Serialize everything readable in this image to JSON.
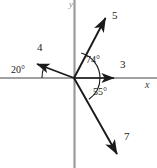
{
  "figure": {
    "type": "angle-diagram",
    "background_color": "#ffffff",
    "axis_color": "#808080",
    "ray_color": "#1a1a1a",
    "arc_color": "#1a1a1a",
    "origin": {
      "x": 74,
      "y": 78
    },
    "axes": {
      "x_label": "x",
      "y_label": "y",
      "x_label_pos": {
        "x": 146,
        "y": 82
      },
      "y_label_pos": {
        "x": 70,
        "y": 1
      },
      "x_start": {
        "x": 0,
        "y": 78
      },
      "x_end": {
        "x": 157,
        "y": 78
      },
      "y_start": {
        "x": 74,
        "y": 0
      },
      "y_end": {
        "x": 74,
        "y": 168
      }
    },
    "rays": [
      {
        "name": "ray-3",
        "label": "3",
        "label_pos": {
          "x": 120,
          "y": 60
        },
        "tip": {
          "x": 118,
          "y": 78
        },
        "angle_deg": 0
      },
      {
        "name": "ray-5",
        "label": "5",
        "label_pos": {
          "x": 113,
          "y": 11
        },
        "tip": {
          "x": 108,
          "y": 14
        },
        "angle_deg": 74
      },
      {
        "name": "ray-4",
        "label": "4",
        "label_pos": {
          "x": 38,
          "y": 43
        },
        "tip": {
          "x": 32,
          "y": 61
        },
        "angle_deg": 160
      },
      {
        "name": "ray-7",
        "label": "7",
        "label_pos": {
          "x": 124,
          "y": 132
        },
        "tip": {
          "x": 121,
          "y": 159
        },
        "angle_deg": -55
      }
    ],
    "angles": [
      {
        "name": "angle-74",
        "label": "74°",
        "value": 74,
        "label_pos": {
          "x": 87,
          "y": 56
        },
        "from_deg": 0,
        "to_deg": 74,
        "radius": 26
      },
      {
        "name": "angle-55",
        "label": "55°",
        "value": 55,
        "label_pos": {
          "x": 94,
          "y": 88
        },
        "from_deg": -55,
        "to_deg": 0,
        "radius": 26
      },
      {
        "name": "angle-20",
        "label": "20°",
        "value": 20,
        "label_pos": {
          "x": 12,
          "y": 66
        },
        "from_deg": 160,
        "to_deg": 180,
        "radius": 32
      }
    ]
  }
}
